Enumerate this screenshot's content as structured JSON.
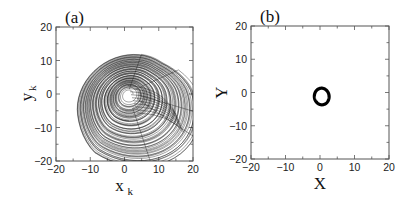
{
  "chart_data": [
    {
      "type": "line",
      "panel_label": "(a)",
      "title": "",
      "xlabel": "x_k",
      "xlabel_main": "x",
      "xlabel_sub": "k",
      "ylabel": "y_k",
      "ylabel_main": "y",
      "ylabel_sub": "k",
      "xlim": [
        -20,
        20
      ],
      "ylim": [
        -20,
        20
      ],
      "xticks": [
        -20,
        -10,
        0,
        10,
        20
      ],
      "yticks": [
        -20,
        -10,
        0,
        10,
        20
      ],
      "minor_ticks_step": 5,
      "grid": false,
      "legend": null,
      "description": "Chaotic spiral attractor centered near (0, 0), trajectory spirals outward to radius ~15, extending x from about -14 to 17 and y from about -18 to 12, with folds on the right side",
      "series": [
        {
          "name": "attractor",
          "shape": "spiral",
          "center": [
            0,
            0
          ],
          "extent_x": [
            -14,
            17
          ],
          "extent_y": [
            -18,
            12
          ]
        }
      ]
    },
    {
      "type": "line",
      "panel_label": "(b)",
      "title": "",
      "xlabel": "X",
      "ylabel": "Y",
      "xlim": [
        -20,
        20
      ],
      "ylim": [
        -20,
        20
      ],
      "xticks": [
        -20,
        -10,
        0,
        10,
        20
      ],
      "yticks": [
        -20,
        -10,
        0,
        10,
        20
      ],
      "minor_ticks_step": 5,
      "grid": false,
      "legend": null,
      "description": "Small closed limit-cycle loop near origin, x from about -2 to 3, y from about -4 to 1.5",
      "series": [
        {
          "name": "limit-cycle",
          "shape": "closed-loop",
          "center": [
            0.5,
            -1.2
          ],
          "extent_x": [
            -2,
            3
          ],
          "extent_y": [
            -4,
            1.5
          ]
        }
      ]
    }
  ]
}
